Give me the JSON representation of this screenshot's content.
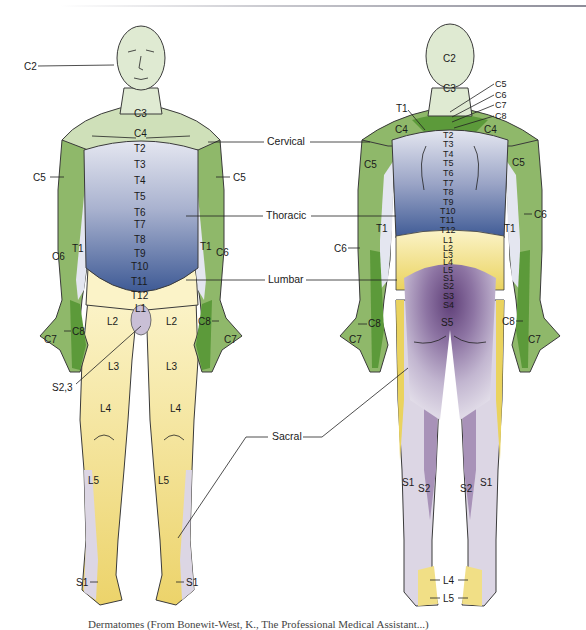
{
  "figure": {
    "caption": "Dermatomes (From Bonewit-West, K., The Professional Medical Assistant...)",
    "colors": {
      "cervical": "#8fb86a",
      "cervical_light": "#cfe0b9",
      "cervical_dark": "#5c9a3a",
      "thoracic_light": "#e4e6f0",
      "thoracic_mid": "#9aa4c6",
      "thoracic_dark": "#3e5a95",
      "lumbar_light": "#fbf3c8",
      "lumbar": "#f1df86",
      "lumbar_dark": "#e6c94a",
      "sacral_light": "#dcd6e4",
      "sacral_mid": "#a892b8",
      "sacral_dark": "#6e4f86",
      "skin_head": "#dfead2"
    }
  },
  "regions": {
    "cervical": "Cervical",
    "thoracic": "Thoracic",
    "lumbar": "Lumbar",
    "sacral": "Sacral"
  },
  "front": {
    "head": "C2",
    "neck": "C3",
    "shoulder": "C4",
    "arm_left_upper": "C5",
    "arm_right_upper": "C5",
    "arm_left_lower": "C6",
    "arm_right_lower": "C6",
    "arm_left_inner": "T1",
    "arm_right_inner": "T1",
    "hand_left": "C7",
    "hand_right": "C7",
    "hand_left_edge": "C8",
    "hand_right_edge": "C8",
    "trunk": [
      "T2",
      "T3",
      "T4",
      "T5",
      "T6",
      "T7",
      "T8",
      "T9",
      "T10",
      "T11",
      "T12"
    ],
    "groin": "L1",
    "thigh_left_upper": "L2",
    "thigh_right_upper": "L2",
    "genital": "S2,3",
    "thigh_left": "L3",
    "thigh_right": "L3",
    "knee_left": "L4",
    "knee_right": "L4",
    "shin_left": "L5",
    "shin_right": "L5",
    "foot_left": "S1",
    "foot_right": "S1"
  },
  "back": {
    "head": "C2",
    "neck": "C3",
    "neck_labels": [
      "C5",
      "C6",
      "C7",
      "C8"
    ],
    "upper_back": "T1",
    "shoulder_left": "C4",
    "shoulder_right": "C4",
    "arm_left_upper": "C5",
    "arm_right_upper": "C5",
    "arm_left_lower": "C6",
    "arm_right_lower": "C6",
    "arm_left_inner": "T1",
    "arm_right_inner": "T1",
    "hand_left": "C7",
    "hand_right": "C7",
    "hand_left_edge": "C8",
    "hand_right_edge": "C8",
    "trunk": [
      "T2",
      "T3",
      "T4",
      "T5",
      "T6",
      "T7",
      "T8",
      "T9",
      "T10",
      "T11",
      "T12"
    ],
    "lumbar": [
      "L1",
      "L2",
      "L3",
      "L4",
      "L5"
    ],
    "sacral": [
      "S1",
      "S2",
      "S3",
      "S4"
    ],
    "buttock_center": "S5",
    "calf_left_outer": "S1",
    "calf_left_inner": "S2",
    "calf_right_inner": "S2",
    "calf_right_outer": "S1",
    "ankle": "L4",
    "foot": "L5"
  }
}
